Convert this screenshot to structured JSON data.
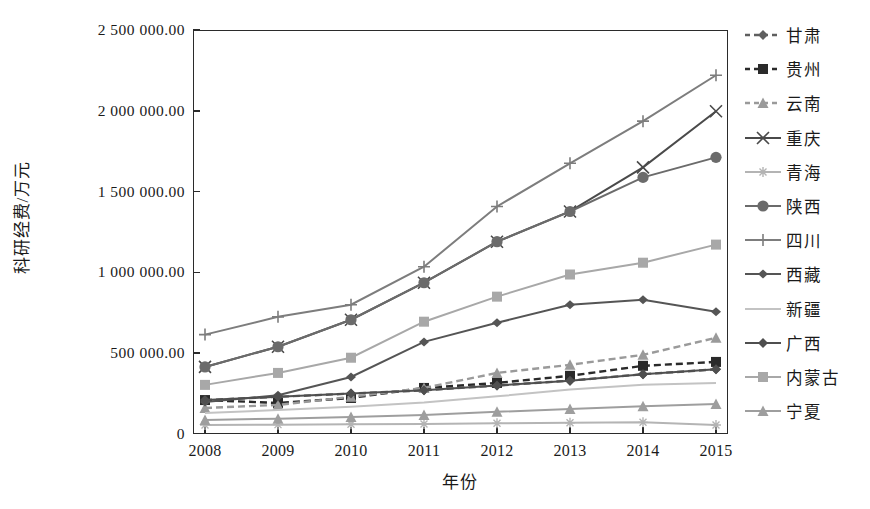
{
  "chart_data": {
    "type": "line",
    "title": "",
    "xlabel": "年份",
    "ylabel": "科研经费/万元",
    "categories": [
      "2008",
      "2009",
      "2010",
      "2011",
      "2012",
      "2013",
      "2014",
      "2015"
    ],
    "x": [
      2008,
      2009,
      2010,
      2011,
      2012,
      2013,
      2014,
      2015
    ],
    "ylim": [
      0,
      2500000
    ],
    "xlim": [
      2008,
      2015
    ],
    "ytick_labels": [
      "0",
      "500 000.00",
      "1 000 000.00",
      "1 500 000.00",
      "2 000 000.00",
      "2 500 000.00"
    ],
    "ytick_values": [
      0,
      500000,
      1000000,
      1500000,
      2000000,
      2500000
    ],
    "grid": false,
    "legend_position": "right",
    "series": [
      {
        "name": "甘肃",
        "marker": "diamond",
        "dash": "dashed",
        "color": "#5f5f5f",
        "values": [
          210000,
          230000,
          250000,
          270000,
          300000,
          330000,
          370000,
          400000
        ]
      },
      {
        "name": "贵州",
        "marker": "square",
        "dash": "dashed",
        "color": "#2a2a2a",
        "values": [
          210000,
          192000,
          223000,
          285000,
          316000,
          360000,
          422000,
          446000
        ]
      },
      {
        "name": "云南",
        "marker": "triangle",
        "dash": "dashed",
        "color": "#9a9a9a",
        "values": [
          161000,
          180000,
          230000,
          285000,
          378000,
          428000,
          490000,
          595000
        ]
      },
      {
        "name": "重庆",
        "marker": "x",
        "dash": "solid",
        "color": "#4a4a4a",
        "values": [
          415000,
          540000,
          707000,
          936000,
          1190000,
          1377000,
          1650000,
          1997000
        ]
      },
      {
        "name": "青海",
        "marker": "star",
        "dash": "solid",
        "color": "#b4b4b4",
        "values": [
          56000,
          58000,
          60000,
          62000,
          66000,
          70000,
          72000,
          56000
        ]
      },
      {
        "name": "陕西",
        "marker": "circle",
        "dash": "solid",
        "color": "#6b6b6b",
        "values": [
          415000,
          540000,
          707000,
          936000,
          1190000,
          1377000,
          1588000,
          1712000
        ]
      },
      {
        "name": "四川",
        "marker": "plus",
        "dash": "solid",
        "color": "#7d7d7d",
        "values": [
          615000,
          725000,
          800000,
          1035000,
          1408000,
          1675000,
          1936000,
          2220000
        ]
      },
      {
        "name": "西藏",
        "marker": "dot",
        "dash": "solid",
        "color": "#555555",
        "values": [
          198000,
          240000,
          353000,
          570000,
          688000,
          800000,
          831000,
          756000
        ]
      },
      {
        "name": "新疆",
        "marker": "none",
        "dash": "solid",
        "color": "#c3c3c3",
        "values": [
          130000,
          148000,
          168000,
          195000,
          233000,
          275000,
          305000,
          316000
        ]
      },
      {
        "name": "广西",
        "marker": "diamond",
        "dash": "solid",
        "color": "#4f4f4f",
        "values": [
          210000,
          230000,
          250000,
          270000,
          300000,
          330000,
          370000,
          400000
        ]
      },
      {
        "name": "内蒙古",
        "marker": "square",
        "dash": "solid",
        "color": "#a8a8a8",
        "values": [
          304000,
          378000,
          472000,
          695000,
          850000,
          987000,
          1060000,
          1172000
        ]
      },
      {
        "name": "宁夏",
        "marker": "triangle",
        "dash": "solid",
        "color": "#9e9e9e",
        "values": [
          87000,
          95000,
          105000,
          118000,
          137000,
          155000,
          172000,
          186000
        ]
      }
    ]
  },
  "legend": {
    "items": [
      "甘肃",
      "贵州",
      "云南",
      "重庆",
      "青海",
      "陕西",
      "四川",
      "西藏",
      "新疆",
      "广西",
      "内蒙古",
      "宁夏"
    ]
  }
}
